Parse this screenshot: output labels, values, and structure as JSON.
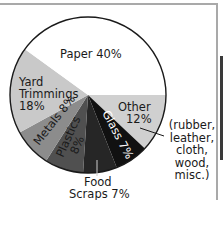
{
  "chart_data": {
    "type": "pie",
    "title": "",
    "categories": [
      "Paper",
      "Yard Trimmings",
      "Metals",
      "Plastics",
      "Food Scraps",
      "Glass",
      "Other"
    ],
    "values": [
      40,
      18,
      8,
      8,
      7,
      7,
      12
    ],
    "value_notes": {
      "Plastics": "Inferred as 100 minus the other labeled slices; the on-image label was too blurred to read directly."
    },
    "labels": [
      "Paper 40%",
      "Yard Trimmings 18%",
      "Metals 8%",
      "Plastics 8%",
      "Food Scraps 7%",
      "Glass 7%",
      "Other 12%"
    ],
    "colors": [
      "#ffffff",
      "#c9c9c9",
      "#8c8c8c",
      "#505050",
      "#262626",
      "#111111",
      "#d0d0d0"
    ],
    "annotation": "(rubber, leather, cloth, wood, misc.)",
    "legend": "none (inline labels)"
  },
  "labels": {
    "paper": "Paper 40%",
    "yard_1": "Yard",
    "yard_2": "Trimmings",
    "yard_3": "18%",
    "metals": "Metals 8%",
    "plastics_1": "Plastics",
    "plastics_2": "8%",
    "glass": "Glass 7%",
    "other_1": "Other",
    "other_2": "12%",
    "food_1": "Food",
    "food_2": "Scraps 7%",
    "note_1": "(rubber,",
    "note_2": "leather,",
    "note_3": "cloth,",
    "note_4": "wood,",
    "note_5": "misc.)"
  }
}
